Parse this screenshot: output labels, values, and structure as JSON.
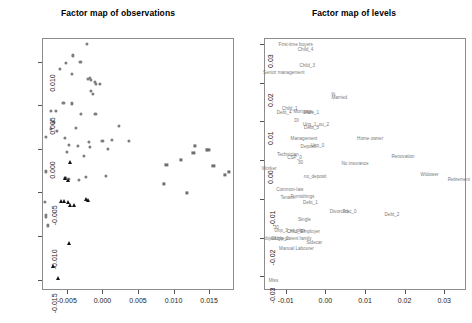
{
  "figure": {
    "width": 472,
    "height": 323,
    "background": "#ffffff",
    "point_color": "#7d7d7d",
    "triangle_color": "#111111",
    "label_color": "#7a7a7a",
    "axis_color": "#8c8c8c"
  },
  "panels": [
    {
      "id": "observations",
      "title": "Factor map of observations"
    },
    {
      "id": "levels",
      "title": "Factor map of levels"
    }
  ],
  "chart_data": [
    {
      "type": "scatter",
      "title": "Factor map of observations",
      "xlabel": "",
      "ylabel": "",
      "xlim": [
        -0.0085,
        0.0185
      ],
      "ylim": [
        -0.0162,
        0.0127
      ],
      "xticks": [
        -0.005,
        0.0,
        0.005,
        0.01,
        0.015
      ],
      "xticklabels": [
        "-0.005",
        "0.000",
        "0.005",
        "0.010",
        "0.015"
      ],
      "yticks": [
        0.01,
        0.005,
        0.0,
        -0.005,
        -0.01,
        -0.015
      ],
      "yticklabels": [
        "0.010",
        "0.005",
        "0.000",
        "-0.005",
        "-0.010",
        "-0.015"
      ],
      "grid": false,
      "legend": "none",
      "series": [
        {
          "name": "group-circle",
          "marker": "circle",
          "color": "#7d7d7d",
          "points": [
            [
              -0.0022,
              0.012
            ],
            [
              -0.0041,
              0.0107
            ],
            [
              -0.0031,
              0.01
            ],
            [
              -0.0051,
              0.0098
            ],
            [
              -0.006,
              0.0092
            ],
            [
              -0.0043,
              0.0086
            ],
            [
              -0.002,
              0.008
            ],
            [
              -0.0018,
              0.0081
            ],
            [
              -0.0016,
              0.0079
            ],
            [
              -0.0011,
              0.0077
            ],
            [
              -0.0009,
              0.0074
            ],
            [
              -0.0003,
              0.0074
            ],
            [
              -0.0016,
              0.0066
            ],
            [
              -0.0013,
              0.0063
            ],
            [
              -0.0055,
              0.0053
            ],
            [
              -0.0043,
              0.0052
            ],
            [
              -0.0073,
              0.0043
            ],
            [
              -0.0066,
              0.0043
            ],
            [
              -0.003,
              0.004
            ],
            [
              -0.001,
              0.004
            ],
            [
              -0.0069,
              0.0031
            ],
            [
              -0.0072,
              0.0023
            ],
            [
              -0.0037,
              0.0024
            ],
            [
              0.0023,
              0.0026
            ],
            [
              -0.0079,
              0.0014
            ],
            [
              -0.0064,
              0.002
            ],
            [
              -0.0053,
              0.0012
            ],
            [
              -0.0019,
              0.0008
            ],
            [
              0.0,
              0.0009
            ],
            [
              0.0013,
              0.001
            ],
            [
              0.0037,
              0.0009
            ],
            [
              -0.0047,
              0.0004
            ],
            [
              -0.0034,
              0.0003
            ],
            [
              -0.0018,
              0.0002
            ],
            [
              0.0008,
              0.0
            ],
            [
              -0.005,
              -0.0004
            ],
            [
              -0.0026,
              -0.0008
            ],
            [
              -0.008,
              -0.0026
            ],
            [
              -0.0052,
              -0.0033
            ],
            [
              -0.0047,
              -0.0035
            ],
            [
              -0.0033,
              -0.0036
            ],
            [
              -0.0023,
              -0.0032
            ],
            [
              0.0005,
              -0.0031
            ],
            [
              -0.0081,
              -0.0061
            ],
            [
              -0.0079,
              -0.0076
            ],
            [
              -0.008,
              -0.0078
            ],
            [
              -0.0077,
              -0.0088
            ]
          ]
        },
        {
          "name": "group-square",
          "marker": "square",
          "color": "#6f6f6f",
          "points": [
            [
              0.013,
              0.0003
            ],
            [
              0.0147,
              -0.0001
            ],
            [
              0.0149,
              -0.0001
            ],
            [
              0.0128,
              -0.0005
            ],
            [
              0.011,
              -0.0013
            ],
            [
              0.009,
              -0.0019
            ],
            [
              0.0156,
              -0.002
            ],
            [
              0.0178,
              -0.0027
            ],
            [
              0.0172,
              -0.003
            ],
            [
              0.0086,
              -0.004
            ],
            [
              0.0119,
              -0.0051
            ]
          ]
        },
        {
          "name": "group-triangle",
          "marker": "triangle",
          "color": "#111111",
          "points": [
            [
              -0.0046,
              -0.0015
            ],
            [
              -0.0053,
              -0.0034
            ],
            [
              -0.0049,
              -0.0036
            ],
            [
              -0.0058,
              -0.006
            ],
            [
              -0.0054,
              -0.006
            ],
            [
              -0.0049,
              -0.0061
            ],
            [
              -0.0045,
              -0.0064
            ],
            [
              -0.004,
              -0.0065
            ],
            [
              -0.0023,
              -0.0058
            ],
            [
              -0.002,
              -0.0059
            ],
            [
              -0.0047,
              -0.0108
            ],
            [
              -0.0069,
              -0.0135
            ],
            [
              -0.0063,
              -0.0148
            ]
          ]
        }
      ]
    },
    {
      "type": "scatter",
      "title": "Factor map of levels",
      "xlabel": "",
      "ylabel": "",
      "xlim": [
        -0.0155,
        0.0355
      ],
      "ylim": [
        -0.0335,
        0.0315
      ],
      "xticks": [
        -0.01,
        0.0,
        0.01,
        0.02,
        0.03
      ],
      "xticklabels": [
        "-0.01",
        "0.00",
        "0.01",
        "0.02",
        "0.03"
      ],
      "yticks": [
        0.03,
        0.02,
        0.01,
        0.0,
        -0.01,
        -0.02,
        -0.03
      ],
      "yticklabels": [
        "0.03",
        "0.02",
        "0.01",
        "0.00",
        "-0.01",
        "-0.02",
        "-0.03"
      ],
      "grid": false,
      "legend": "none",
      "labels": [
        {
          "text": "First-time buyers",
          "x": -0.0075,
          "y": 0.0297
        },
        {
          "text": "Child_4",
          "x": -0.005,
          "y": 0.0285
        },
        {
          "text": "Child_3",
          "x": -0.0046,
          "y": 0.0244
        },
        {
          "text": "Senior management",
          "x": -0.0105,
          "y": 0.0224
        },
        {
          "text": "%",
          "x": 0.002,
          "y": 0.0167
        },
        {
          "text": "Married",
          "x": 0.0035,
          "y": 0.0159
        },
        {
          "text": "Child_1",
          "x": -0.009,
          "y": 0.0133
        },
        {
          "text": "Debt_4",
          "x": -0.0104,
          "y": 0.0122
        },
        {
          "text": "Mortgage",
          "x": -0.0056,
          "y": 0.0123
        },
        {
          "text": "Male_1",
          "x": -0.0035,
          "y": 0.0122
        },
        {
          "text": "DI",
          "x": -0.0073,
          "y": 0.0101
        },
        {
          "text": "Unp_1_ou_2",
          "x": -0.0024,
          "y": 0.009
        },
        {
          "text": "Debt_3",
          "x": -0.0035,
          "y": 0.0083
        },
        {
          "text": "Management",
          "x": -0.0054,
          "y": 0.0055
        },
        {
          "text": "Home owner",
          "x": 0.0113,
          "y": 0.0055
        },
        {
          "text": "Deposit",
          "x": -0.0043,
          "y": 0.0034
        },
        {
          "text": "Unp_0",
          "x": -0.002,
          "y": 0.0036
        },
        {
          "text": "Technician",
          "x": -0.0095,
          "y": 0.0014
        },
        {
          "text": "CSP_0",
          "x": -0.0078,
          "y": 0.0006
        },
        {
          "text": "Renovation",
          "x": 0.0196,
          "y": 0.0008
        },
        {
          "text": "30",
          "x": -0.0063,
          "y": -0.0008
        },
        {
          "text": "No insurance",
          "x": 0.0075,
          "y": -0.001
        },
        {
          "text": "Worker",
          "x": -0.0142,
          "y": -0.0023
        },
        {
          "text": "no_deposit",
          "x": -0.0026,
          "y": -0.0043
        },
        {
          "text": "Widower",
          "x": 0.0263,
          "y": -0.0038
        },
        {
          "text": "Retirement",
          "x": 0.0337,
          "y": -0.005
        },
        {
          "text": "Common-law",
          "x": -0.009,
          "y": -0.0077
        },
        {
          "text": "Tenant",
          "x": -0.0096,
          "y": -0.0098
        },
        {
          "text": "Furnishings",
          "x": -0.0058,
          "y": -0.0096
        },
        {
          "text": "Debt_1",
          "x": -0.0038,
          "y": -0.011
        },
        {
          "text": "Divorced",
          "x": 0.0034,
          "y": -0.0133
        },
        {
          "text": "Trac_0",
          "x": 0.0061,
          "y": -0.0135
        },
        {
          "text": "Debt_2",
          "x": 0.0168,
          "y": -0.0141
        },
        {
          "text": "Single",
          "x": -0.0053,
          "y": -0.0155
        },
        {
          "text": "30",
          "x": -0.0124,
          "y": -0.0175
        },
        {
          "text": "Unp_3_et_plus",
          "x": -0.009,
          "y": -0.0184
        },
        {
          "text": "Child_0",
          "x": -0.0078,
          "y": -0.0186
        },
        {
          "text": "Employer",
          "x": -0.0038,
          "y": -0.0186
        },
        {
          "text": "object",
          "x": -0.014,
          "y": -0.0203
        },
        {
          "text": "Unp_2",
          "x": -0.011,
          "y": -0.0203
        },
        {
          "text": "Single-parent family",
          "x": -0.0086,
          "y": -0.0203
        },
        {
          "text": "Sidecar",
          "x": -0.0028,
          "y": -0.0213
        },
        {
          "text": "Manual Labourer",
          "x": -0.0073,
          "y": -0.0228
        },
        {
          "text": "Miss",
          "x": -0.0131,
          "y": -0.0312
        }
      ]
    }
  ]
}
